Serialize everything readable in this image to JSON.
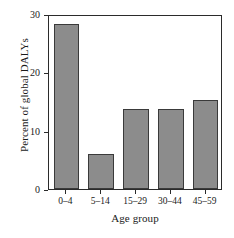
{
  "chart_data": {
    "type": "bar",
    "title": "",
    "subtitle": "",
    "xlabel": "Age group",
    "ylabel": "Percent of global DALYs",
    "categories": [
      "0–4",
      "5–14",
      "15–29",
      "30–44",
      "45–59"
    ],
    "values": [
      28.3,
      6.0,
      13.7,
      13.7,
      15.2
    ],
    "ylim": [
      0,
      30
    ],
    "yticks": [
      0,
      10,
      20,
      30
    ],
    "ytick_labels": [
      "0",
      "10",
      "20",
      "30"
    ],
    "grid": false,
    "legend": null,
    "legend_position": "none",
    "series": [
      {
        "name": "Percent of global DALYs",
        "values": [
          28.3,
          6.0,
          13.7,
          13.7,
          15.2
        ]
      }
    ],
    "annotations": []
  },
  "style": {
    "bar_fill": "#8c8c8c",
    "bar_stroke": "#3a3a3a",
    "axis_color": "#2b2b2b",
    "background": "#ffffff",
    "text_color": "#1a1a1a"
  }
}
